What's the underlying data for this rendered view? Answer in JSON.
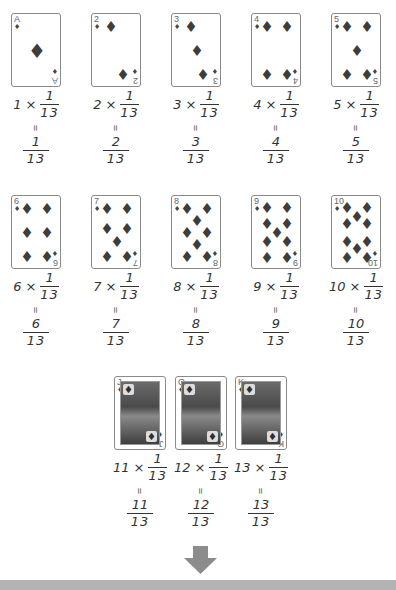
{
  "diagram": {
    "multiplier_symbol": "×",
    "equals_symbol": "=",
    "unit_fraction": {
      "numerator": "1",
      "denominator": "13"
    },
    "cards": [
      {
        "rank": "A",
        "value": "1",
        "suit": "♦",
        "multiplier": "1",
        "result_num": "1",
        "result_den": "13"
      },
      {
        "rank": "2",
        "value": "2",
        "suit": "♦",
        "multiplier": "2",
        "result_num": "2",
        "result_den": "13"
      },
      {
        "rank": "3",
        "value": "3",
        "suit": "♦",
        "multiplier": "3",
        "result_num": "3",
        "result_den": "13"
      },
      {
        "rank": "4",
        "value": "4",
        "suit": "♦",
        "multiplier": "4",
        "result_num": "4",
        "result_den": "13"
      },
      {
        "rank": "5",
        "value": "5",
        "suit": "♦",
        "multiplier": "5",
        "result_num": "5",
        "result_den": "13"
      },
      {
        "rank": "6",
        "value": "6",
        "suit": "♦",
        "multiplier": "6",
        "result_num": "6",
        "result_den": "13"
      },
      {
        "rank": "7",
        "value": "7",
        "suit": "♦",
        "multiplier": "7",
        "result_num": "7",
        "result_den": "13"
      },
      {
        "rank": "8",
        "value": "8",
        "suit": "♦",
        "multiplier": "8",
        "result_num": "8",
        "result_den": "13"
      },
      {
        "rank": "9",
        "value": "9",
        "suit": "♦",
        "multiplier": "9",
        "result_num": "9",
        "result_den": "13"
      },
      {
        "rank": "10",
        "value": "10",
        "suit": "♦",
        "multiplier": "10",
        "result_num": "10",
        "result_den": "13"
      },
      {
        "rank": "J",
        "value": "11",
        "suit": "♦",
        "multiplier": "11",
        "result_num": "11",
        "result_den": "13"
      },
      {
        "rank": "Q",
        "value": "12",
        "suit": "♦",
        "multiplier": "12",
        "result_num": "12",
        "result_den": "13"
      },
      {
        "rank": "K",
        "value": "13",
        "suit": "♦",
        "multiplier": "13",
        "result_num": "13",
        "result_den": "13"
      }
    ],
    "colors": {
      "pip": "#3d3d3d",
      "card_border": "#8a8a8a",
      "arrow": "#8c8c8c",
      "bottom_bar": "#b3b3b3",
      "text": "#333333"
    }
  }
}
